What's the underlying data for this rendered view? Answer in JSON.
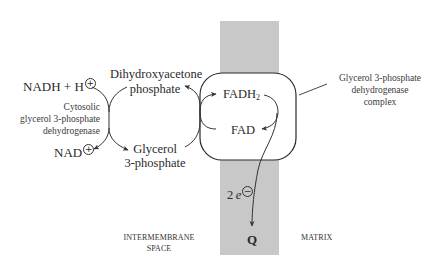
{
  "colors": {
    "membrane": "#c8c8c8",
    "line": "#333333",
    "text": "#2a2a2a",
    "background": "#ffffff"
  },
  "cytosol": {
    "nadh": "NADH + H",
    "nadh_charge": "+",
    "nad": "NAD",
    "nad_charge": "+",
    "enzyme_line1": "Cytosolic",
    "enzyme_line2": "glycerol 3-phosphate",
    "enzyme_line3": "dehydrogenase",
    "dhap_line1": "Dihydroxyacetone",
    "dhap_line2": "phosphate",
    "g3p_line1": "Glycerol",
    "g3p_line2": "3-phosphate"
  },
  "complex": {
    "fadh2": "FADH",
    "fadh2_sub": "2",
    "fad": "FAD",
    "label_line1": "Glycerol 3-phosphate",
    "label_line2": "dehydrogenase",
    "label_line3": "complex"
  },
  "electrons": {
    "count": "2",
    "symbol": "e",
    "charge": "−"
  },
  "acceptor": "Q",
  "regions": {
    "intermembrane_line1": "INTERMEMBRANE",
    "intermembrane_line2": "SPACE",
    "matrix": "MATRIX"
  }
}
